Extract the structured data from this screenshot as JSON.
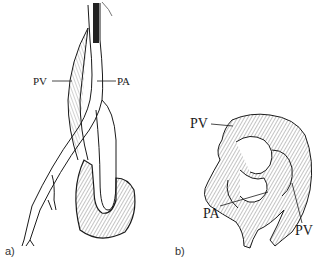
{
  "figure": {
    "panel_a": {
      "label": "a)",
      "annotations": [
        {
          "text": "PV",
          "meaning": "pulmonary vein"
        },
        {
          "text": "PA",
          "meaning": "pulmonary artery"
        }
      ]
    },
    "panel_b": {
      "label": "b)",
      "annotations": [
        {
          "text": "PV"
        },
        {
          "text": "PA"
        },
        {
          "text": "PV"
        }
      ]
    }
  },
  "colors": {
    "line": "#1a1a1a",
    "hatch": "#555555",
    "background": "#ffffff"
  }
}
